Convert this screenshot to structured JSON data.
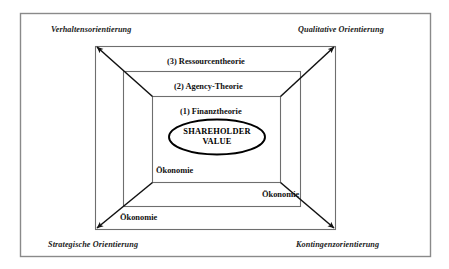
{
  "diagram": {
    "type": "nested-framework-diagram",
    "center_node": {
      "label_line1": "SHAREHOLDER",
      "label_line2": "VALUE",
      "shape": "ellipse"
    },
    "corner_labels": [
      {
        "id": "top-left",
        "text": "Verhaltensorientierung"
      },
      {
        "id": "top-right",
        "text": "Qualitative Orientierung"
      },
      {
        "id": "bottom-left",
        "text": "Strategische Orientierung"
      },
      {
        "id": "bottom-right",
        "text": "Kontingenzorientierung"
      }
    ],
    "layers": [
      {
        "index": "1",
        "text": "(1) Finanztheorie"
      },
      {
        "index": "2",
        "text": "(2) Agency-Theorie"
      },
      {
        "index": "3",
        "text": "(3) Ressourcentheorie"
      }
    ],
    "economy_labels": [
      {
        "id": "inner",
        "text": "Ökonomie"
      },
      {
        "id": "middle",
        "text": "Ökonomie"
      },
      {
        "id": "outer",
        "text": "Ökonomie"
      }
    ],
    "colors": {
      "frame": "#8a8a8a",
      "rect_stroke": "#6e6e6e",
      "arrow": "#111111",
      "ellipse_stroke": "#000000",
      "text": "#111111",
      "background": "#ffffff"
    }
  }
}
